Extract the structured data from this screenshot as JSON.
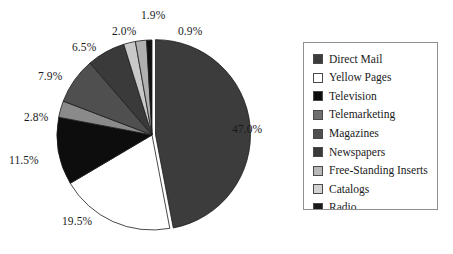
{
  "chart_data": {
    "type": "pie",
    "title": "",
    "xlabel": "",
    "ylabel": "",
    "legend_position": "right",
    "grid": false,
    "start_angle_deg": 0,
    "direction": "clockwise",
    "categories": [
      "Direct Mail",
      "Yellow Pages",
      "Television",
      "Telemarketing",
      "Magazines",
      "Newspapers",
      "Free-Standing Inserts",
      "Catalogs",
      "Radio"
    ],
    "values": [
      47.0,
      19.5,
      11.5,
      2.8,
      7.9,
      6.5,
      2.0,
      1.9,
      0.9
    ],
    "value_labels": [
      "47.0%",
      "19.5%",
      "11.5%",
      "2.8%",
      "7.9%",
      "6.5%",
      "2.0%",
      "1.9%",
      "0.9%"
    ],
    "colors": [
      "#3c3c3c",
      "#ffffff",
      "#0d0d0d",
      "#8a8a8a",
      "#4f4f4f",
      "#3a3a3a",
      "#c9c9c9",
      "#b0b0b0",
      "#111111"
    ]
  },
  "legend": {
    "items": [
      {
        "label": "Direct Mail",
        "color": "#3c3c3c"
      },
      {
        "label": "Yellow Pages",
        "color": "#ffffff"
      },
      {
        "label": "Television",
        "color": "#0d0d0d"
      },
      {
        "label": "Telemarketing",
        "color": "#6e6e6e"
      },
      {
        "label": "Magazines",
        "color": "#4f4f4f"
      },
      {
        "label": "Newspapers",
        "color": "#3a3a3a"
      },
      {
        "label": "Free-Standing Inserts",
        "color": "#b8b8b8"
      },
      {
        "label": "Catalogs",
        "color": "#d2d2d2"
      },
      {
        "label": "Radio",
        "color": "#1a1a1a"
      }
    ]
  },
  "labels": {
    "direct_mail_pct": "47.0%",
    "yellow_pages_pct": "19.5%",
    "television_pct": "11.5%",
    "telemarketing_pct": "2.8%",
    "magazines_pct": "7.9%",
    "newspapers_pct": "6.5%",
    "free_standing_inserts_pct": "2.0%",
    "catalogs_pct": "1.9%",
    "radio_pct": "0.9%"
  }
}
